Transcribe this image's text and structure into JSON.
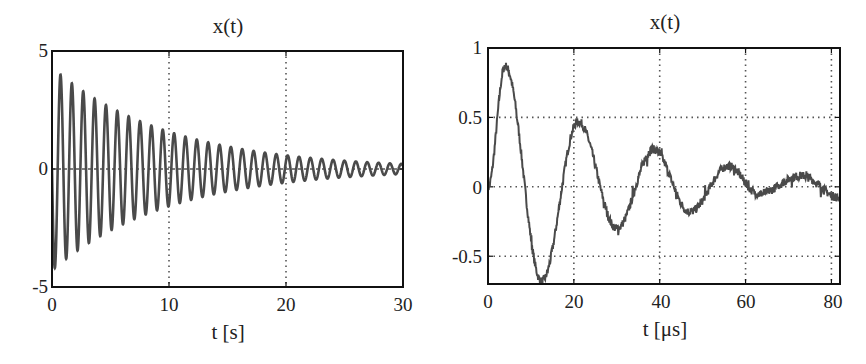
{
  "chart_data": [
    {
      "type": "line",
      "title": "x(t)",
      "xlabel": "t [s]",
      "ylabel": "",
      "xlim": [
        0,
        30
      ],
      "ylim": [
        -5,
        5
      ],
      "xticks": [
        "0",
        "10",
        "20",
        "30"
      ],
      "yticks": [
        "5",
        "0",
        "-5"
      ],
      "grid": "x-gridlines dotted at 10 and 20; dashed zero line",
      "legend": null,
      "description": "Exponentially damped sinusoid, approx. 1.03 Hz, envelope ~4.3·e^(-0.1 t)",
      "model": {
        "amplitude": 4.3,
        "decay": 0.1,
        "frequency_hz": 1.03,
        "phase": "starts at 0 going negative"
      },
      "series": [
        {
          "name": "x(t)",
          "envelope_points": [
            {
              "t": 0.45,
              "x": -4.3
            },
            {
              "t": 0.95,
              "x": 4.1
            },
            {
              "t": 5,
              "x": 2.6
            },
            {
              "t": 10,
              "x": 1.6
            },
            {
              "t": 15,
              "x": 1.0
            },
            {
              "t": 20,
              "x": 0.6
            },
            {
              "t": 25,
              "x": 0.35
            },
            {
              "t": 30,
              "x": 0.25
            }
          ]
        }
      ]
    },
    {
      "type": "line",
      "title": "x(t)",
      "xlabel": "t [μs]",
      "ylabel": "",
      "xlim": [
        0,
        82
      ],
      "ylim": [
        -0.7,
        1
      ],
      "xticks": [
        "0",
        "20",
        "40",
        "60",
        "80"
      ],
      "yticks": [
        "1",
        "0.5",
        "0",
        "-0.5"
      ],
      "grid": "dotted grid at each tick",
      "legend": null,
      "description": "Noisy damped oscillation, period ~17.3 μs",
      "series": [
        {
          "name": "x(t)",
          "x": [
            0,
            4,
            12.5,
            21,
            30,
            38.5,
            47,
            56,
            63,
            73,
            82
          ],
          "y": [
            0.0,
            0.87,
            -0.68,
            0.47,
            -0.3,
            0.27,
            -0.18,
            0.15,
            -0.05,
            0.08,
            -0.08
          ]
        }
      ]
    }
  ],
  "panels": {
    "left": {
      "title": "x(t)",
      "xlabel": "t [s]",
      "xticks": [
        "0",
        "10",
        "20",
        "30"
      ],
      "yticks": [
        "5",
        "0",
        "-5"
      ]
    },
    "right": {
      "title": "x(t)",
      "xlabel": "t [μs]",
      "xticks": [
        "0",
        "20",
        "40",
        "60",
        "80"
      ],
      "yticks": [
        "1",
        "0.5",
        "0",
        "-0.5"
      ]
    }
  },
  "colors": {
    "line": "#4a4a4a",
    "axes": "#111111",
    "grid": "#555555"
  }
}
